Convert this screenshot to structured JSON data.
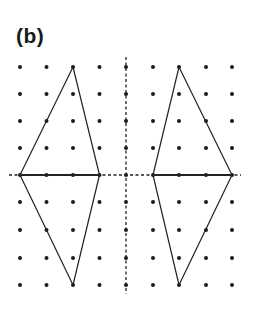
{
  "figure": {
    "label": "(b)",
    "colors": {
      "ink": "#222222",
      "dot": "#1a1a1a",
      "background": "#ffffff"
    },
    "grid": {
      "x": [
        20,
        46.5,
        73,
        99.5,
        126,
        153,
        179,
        206,
        232
      ],
      "y": [
        67,
        94,
        121,
        148,
        175,
        202,
        230,
        258,
        285
      ],
      "dot_radius": 2
    },
    "mirror_line_vertical": {
      "x": 126,
      "y1": 57,
      "y2": 294,
      "style": "dashed"
    },
    "mirror_line_horizontal": {
      "y": 175,
      "x1": 9,
      "x2": 241,
      "style": "dashed"
    },
    "shapes": [
      {
        "name": "left-kite",
        "points": [
          [
            73,
            67
          ],
          [
            99.5,
            175
          ],
          [
            73,
            285
          ],
          [
            20,
            175
          ]
        ],
        "diagonal": [
          [
            20,
            175
          ],
          [
            99.5,
            175
          ]
        ]
      },
      {
        "name": "right-kite",
        "points": [
          [
            179,
            67
          ],
          [
            232,
            175
          ],
          [
            179,
            285
          ],
          [
            153,
            175
          ]
        ],
        "diagonal": [
          [
            153,
            175
          ],
          [
            232,
            175
          ]
        ]
      }
    ]
  }
}
